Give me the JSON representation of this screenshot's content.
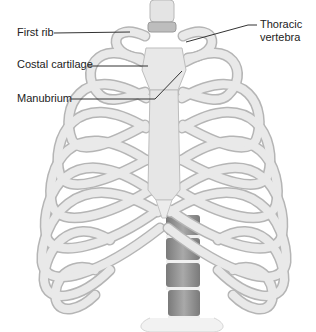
{
  "figure": {
    "labels": [
      {
        "id": "first-rib",
        "text": "First rib"
      },
      {
        "id": "costal-cartilage",
        "text": "Costal cartilage"
      },
      {
        "id": "manubrium",
        "text": "Manubrium"
      },
      {
        "id": "thoracic-vertebra",
        "text": "Thoracic vertebra",
        "lines": [
          "Thoracic",
          "vertebra"
        ]
      }
    ],
    "colors": {
      "background": "#ffffff",
      "bone": "#e6e6e6",
      "bone_shadow": "#b5b5b5",
      "cartilage": "#ededed",
      "vertebra_dark": "#8c8c8c",
      "leader_line": "#333333",
      "text": "#222222"
    }
  }
}
